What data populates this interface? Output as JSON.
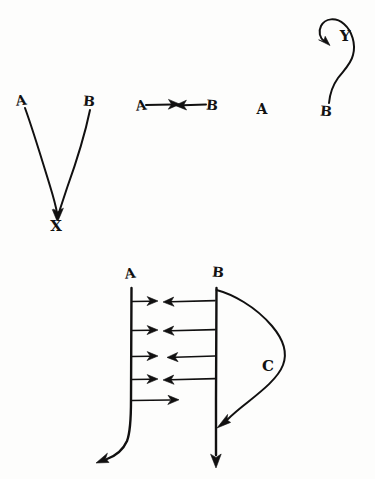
{
  "page": {
    "kind": "hand-drawn-diagram",
    "background_color": "#fdfdfc",
    "ink_color": "#111010",
    "width": 375,
    "height": 479
  },
  "panels": {
    "converging": {
      "name": "converging-arrows-to-x",
      "labels": {
        "source_left": "A",
        "source_right": "B",
        "target": "X"
      }
    },
    "opposing": {
      "name": "opposing-arrows-row",
      "labels": {
        "left": "A",
        "right": "B",
        "isolated": "A"
      }
    },
    "loop": {
      "name": "looping-arrow-to-y",
      "labels": {
        "start": "B",
        "target": "Y"
      }
    },
    "field": {
      "name": "two-line-field-diagram",
      "labels": {
        "line_left": "A",
        "line_right": "B",
        "curve": "C"
      }
    }
  }
}
